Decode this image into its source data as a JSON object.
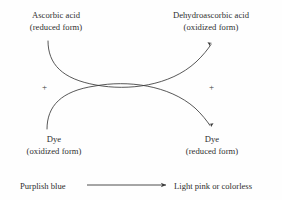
{
  "figure": {
    "background_color": "#fefefe",
    "stroke_color": "#3a3a3a",
    "text_color": "#2e2e2e"
  },
  "labels": {
    "top_left": {
      "line1": "Ascorbic acid",
      "line2": "(reduced form)"
    },
    "top_right": {
      "line1": "Dehydroascorbic acid",
      "line2": "(oxidized form)"
    },
    "bottom_left": {
      "line1": "Dye",
      "line2": "(oxidized form)"
    },
    "bottom_right": {
      "line1": "Dye",
      "line2": "(reduced form)"
    }
  },
  "operators": {
    "plus_left": "+",
    "plus_right": "+"
  },
  "footer": {
    "left_text": "Purplish blue",
    "right_text": "Light pink or colorless",
    "arrow": "straight-right-arrow"
  },
  "arrows": {
    "upper": "curved-arrow-ascorbic-to-dehydroascorbic",
    "lower": "curved-arrow-dye-oxidized-to-dye-reduced"
  }
}
